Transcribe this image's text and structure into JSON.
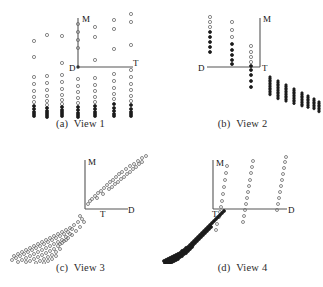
{
  "figure": {
    "background": "#ffffff",
    "point_color": "#6b6b6b",
    "dark_point_color": "#1c1c1c",
    "axis_color": "#555555",
    "label_color": "#111111",
    "caption_color": "#2b2b2b",
    "width": 323,
    "height": 287
  },
  "panels": [
    {
      "id": "a",
      "caption_index": "(a)",
      "caption_text": "View 1",
      "axis_labels": {
        "vertical": "M",
        "horizontal_far": "T",
        "origin": "D"
      }
    },
    {
      "id": "b",
      "caption_index": "(b)",
      "caption_text": "View 2",
      "axis_labels": {
        "vertical": "M",
        "horizontal_far": "T",
        "origin": "D"
      }
    },
    {
      "id": "c",
      "caption_index": "(c)",
      "caption_text": "View 3",
      "axis_labels": {
        "vertical": "M",
        "horizontal_far": "D",
        "origin": "T"
      }
    },
    {
      "id": "d",
      "caption_index": "(d)",
      "caption_text": "View 4",
      "axis_labels": {
        "vertical": "M",
        "horizontal_far": "D",
        "origin": "T"
      }
    }
  ],
  "chart_data": [
    {
      "type": "scatter",
      "panel": "a",
      "title": "(a) View 1",
      "xlabel": "T",
      "ylabel": "M",
      "origin_label": "D",
      "axes": {
        "origin": [
          78,
          67
        ],
        "y_top": [
          78,
          18
        ],
        "x_right": [
          133,
          67
        ]
      },
      "grid": false,
      "legend": "none",
      "marker": "open-circle",
      "description": "Points arranged in seven vertical columns; sparse above the horizontal axis, dense stacked clusters below it.",
      "columns": [
        {
          "x": 34,
          "ys": [
            41,
            57,
            77,
            84,
            91,
            97,
            102,
            106,
            109,
            112,
            114,
            116
          ]
        },
        {
          "x": 47,
          "ys": [
            35,
            76,
            83,
            90,
            96,
            101,
            105,
            108,
            111,
            113,
            115,
            117
          ]
        },
        {
          "x": 62,
          "ys": [
            36,
            63,
            75,
            82,
            89,
            95,
            100,
            104,
            107,
            110,
            112,
            114,
            116
          ]
        },
        {
          "x": 78,
          "ys": [
            24,
            32,
            40,
            48,
            79,
            86,
            92,
            98,
            103,
            107,
            110,
            113,
            115,
            117
          ]
        },
        {
          "x": 95,
          "ys": [
            27,
            37,
            60,
            78,
            85,
            91,
            97,
            102,
            106,
            109,
            112,
            114,
            116
          ]
        },
        {
          "x": 114,
          "ys": [
            20,
            29,
            49,
            74,
            81,
            88,
            94,
            99,
            104,
            108,
            111,
            114,
            116
          ]
        },
        {
          "x": 131,
          "ys": [
            14,
            22,
            45,
            70,
            77,
            84,
            90,
            96,
            101,
            105,
            109,
            112,
            114,
            116
          ]
        }
      ]
    },
    {
      "type": "scatter",
      "panel": "b",
      "title": "(b) View 2",
      "xlabel": "T",
      "ylabel": "M",
      "origin_label": "D",
      "axes": {
        "origin": [
          45,
          67
        ],
        "y_top": [
          98,
          18
        ],
        "x_right": [
          98,
          67
        ]
      },
      "grid": false,
      "legend": "none",
      "marker": "open-circle",
      "description": "Three vertical point columns left of the axis plus a descending diagonal train of short vertical streaks to the lower right.",
      "columns": [
        {
          "x": 48,
          "ys": [
            17,
            22,
            27,
            32,
            37,
            42,
            47,
            52
          ]
        },
        {
          "x": 70,
          "ys": [
            22,
            30,
            37,
            44,
            50,
            55,
            60,
            64
          ]
        },
        {
          "x": 89,
          "ys": [
            46,
            52,
            57,
            62,
            66,
            70,
            75,
            81,
            87
          ]
        }
      ],
      "diagonal_streaks": [
        {
          "x": 108,
          "y_start": 77,
          "y_end": 95
        },
        {
          "x": 116,
          "y_start": 81,
          "y_end": 99
        },
        {
          "x": 124,
          "y_start": 85,
          "y_end": 101
        },
        {
          "x": 132,
          "y_start": 89,
          "y_end": 104
        },
        {
          "x": 140,
          "y_start": 93,
          "y_end": 106
        },
        {
          "x": 146,
          "y_start": 96,
          "y_end": 108
        },
        {
          "x": 152,
          "y_start": 99,
          "y_end": 110
        },
        {
          "x": 157,
          "y_start": 102,
          "y_end": 112
        }
      ]
    },
    {
      "type": "scatter",
      "panel": "c",
      "title": "(c) View 3",
      "xlabel": "D",
      "ylabel": "M",
      "origin_label": "T",
      "axes": {
        "origin": [
          85,
          65
        ],
        "y_top": [
          85,
          16
        ],
        "x_right": [
          128,
          65
        ]
      },
      "grid": false,
      "legend": "none",
      "marker": "open-circle",
      "description": "A broad diagonal band of open circles rising from lower-left to upper-right, passing through the origin region.",
      "upper_arm": [
        [
          88,
          60
        ],
        [
          90,
          57
        ],
        [
          92,
          55
        ],
        [
          95,
          52
        ],
        [
          98,
          49
        ],
        [
          101,
          47
        ],
        [
          104,
          44
        ],
        [
          107,
          41
        ],
        [
          110,
          38
        ],
        [
          113,
          36
        ],
        [
          116,
          33
        ],
        [
          119,
          30
        ],
        [
          122,
          28
        ],
        [
          126,
          25
        ],
        [
          130,
          22
        ],
        [
          134,
          20
        ],
        [
          138,
          17
        ],
        [
          142,
          14
        ],
        [
          146,
          12
        ],
        [
          97,
          54
        ],
        [
          103,
          50
        ],
        [
          109,
          45
        ],
        [
          115,
          40
        ],
        [
          121,
          35
        ],
        [
          127,
          30
        ],
        [
          133,
          25
        ],
        [
          139,
          20
        ],
        [
          112,
          43
        ],
        [
          118,
          38
        ],
        [
          124,
          33
        ],
        [
          130,
          28
        ],
        [
          136,
          23
        ],
        [
          142,
          18
        ]
      ],
      "lower_band": [
        [
          14,
          112
        ],
        [
          18,
          110
        ],
        [
          22,
          108
        ],
        [
          26,
          106
        ],
        [
          30,
          104
        ],
        [
          34,
          102
        ],
        [
          38,
          100
        ],
        [
          42,
          98
        ],
        [
          46,
          96
        ],
        [
          50,
          94
        ],
        [
          54,
          92
        ],
        [
          58,
          90
        ],
        [
          62,
          88
        ],
        [
          66,
          86
        ],
        [
          70,
          84
        ],
        [
          74,
          81
        ],
        [
          78,
          78
        ],
        [
          12,
          116
        ],
        [
          16,
          114
        ],
        [
          20,
          112
        ],
        [
          24,
          110
        ],
        [
          28,
          108
        ],
        [
          32,
          106
        ],
        [
          36,
          104
        ],
        [
          40,
          102
        ],
        [
          44,
          100
        ],
        [
          48,
          98
        ],
        [
          52,
          96
        ],
        [
          56,
          94
        ],
        [
          60,
          92
        ],
        [
          64,
          90
        ],
        [
          68,
          88
        ],
        [
          72,
          85
        ],
        [
          18,
          118
        ],
        [
          22,
          116
        ],
        [
          26,
          114
        ],
        [
          30,
          112
        ],
        [
          34,
          110
        ],
        [
          38,
          108
        ],
        [
          42,
          106
        ],
        [
          46,
          104
        ],
        [
          50,
          102
        ],
        [
          54,
          100
        ],
        [
          58,
          98
        ],
        [
          62,
          96
        ],
        [
          66,
          93
        ],
        [
          70,
          90
        ],
        [
          26,
          118
        ],
        [
          30,
          117
        ],
        [
          34,
          115
        ],
        [
          38,
          113
        ],
        [
          42,
          111
        ],
        [
          46,
          109
        ],
        [
          50,
          107
        ],
        [
          54,
          105
        ],
        [
          58,
          102
        ],
        [
          62,
          99
        ],
        [
          66,
          96
        ],
        [
          36,
          119
        ],
        [
          40,
          117
        ],
        [
          44,
          115
        ],
        [
          48,
          113
        ],
        [
          52,
          111
        ],
        [
          56,
          108
        ],
        [
          60,
          105
        ],
        [
          44,
          119
        ],
        [
          48,
          117
        ],
        [
          52,
          115
        ],
        [
          56,
          112
        ],
        [
          60,
          100
        ],
        [
          64,
          97
        ],
        [
          68,
          94
        ],
        [
          72,
          91
        ],
        [
          76,
          87
        ],
        [
          80,
          83
        ],
        [
          84,
          78
        ],
        [
          82,
          75
        ],
        [
          80,
          72
        ]
      ]
    },
    {
      "type": "scatter",
      "panel": "d",
      "title": "(d) View 4",
      "xlabel": "D",
      "ylabel": "M",
      "origin_label": "T",
      "axes": {
        "origin": [
          51,
          65
        ],
        "y_top": [
          51,
          16
        ],
        "x_right": [
          125,
          65
        ]
      },
      "grid": false,
      "legend": "none",
      "marker": "open-circle",
      "description": "Three steep ascending point columns above the horizontal axis, and a dense dark curved tail descending to the lower-left.",
      "ascending_columns": [
        {
          "points": [
            [
              57,
              73
            ],
            [
              58,
              68
            ],
            [
              59,
              63
            ],
            [
              60,
              57
            ],
            [
              61,
              50
            ],
            [
              62,
              43
            ],
            [
              63,
              36
            ],
            [
              64,
              29
            ],
            [
              65,
              22
            ],
            [
              55,
              80
            ],
            [
              54,
              86
            ]
          ]
        },
        {
          "points": [
            [
              83,
              66
            ],
            [
              84,
              60
            ],
            [
              85,
              54
            ],
            [
              86,
              48
            ],
            [
              87,
              42
            ],
            [
              88,
              36
            ],
            [
              89,
              29
            ],
            [
              90,
              23
            ],
            [
              91,
              17
            ],
            [
              82,
              72
            ],
            [
              81,
              78
            ]
          ]
        },
        {
          "points": [
            [
              116,
              60
            ],
            [
              117,
              54
            ],
            [
              118,
              48
            ],
            [
              119,
              42
            ],
            [
              120,
              36
            ],
            [
              121,
              30
            ],
            [
              122,
              24
            ],
            [
              123,
              18
            ],
            [
              124,
              13
            ],
            [
              115,
              66
            ]
          ]
        }
      ],
      "dense_tail": [
        [
          2,
          117
        ],
        [
          4,
          116
        ],
        [
          6,
          115
        ],
        [
          8,
          114
        ],
        [
          10,
          113
        ],
        [
          12,
          112
        ],
        [
          14,
          111
        ],
        [
          16,
          110
        ],
        [
          18,
          109
        ],
        [
          20,
          107
        ],
        [
          22,
          106
        ],
        [
          24,
          104
        ],
        [
          26,
          103
        ],
        [
          28,
          101
        ],
        [
          30,
          99
        ],
        [
          32,
          97
        ],
        [
          34,
          95
        ],
        [
          36,
          93
        ],
        [
          38,
          91
        ],
        [
          40,
          89
        ],
        [
          42,
          87
        ],
        [
          44,
          85
        ],
        [
          46,
          83
        ],
        [
          48,
          81
        ],
        [
          50,
          79
        ],
        [
          52,
          77
        ],
        [
          54,
          75
        ],
        [
          56,
          73
        ],
        [
          58,
          71
        ],
        [
          60,
          69
        ],
        [
          62,
          67
        ],
        [
          3,
          119
        ],
        [
          5,
          118
        ],
        [
          7,
          117
        ],
        [
          9,
          116
        ],
        [
          11,
          115
        ],
        [
          13,
          114
        ],
        [
          15,
          113
        ],
        [
          17,
          112
        ],
        [
          19,
          111
        ],
        [
          21,
          109
        ],
        [
          23,
          108
        ],
        [
          25,
          106
        ],
        [
          27,
          105
        ],
        [
          29,
          103
        ],
        [
          31,
          101
        ],
        [
          33,
          99
        ],
        [
          35,
          97
        ],
        [
          37,
          95
        ],
        [
          39,
          93
        ],
        [
          41,
          91
        ],
        [
          43,
          89
        ],
        [
          45,
          87
        ],
        [
          47,
          85
        ],
        [
          49,
          83
        ],
        [
          6,
          120
        ],
        [
          8,
          119
        ],
        [
          10,
          118
        ],
        [
          12,
          117
        ],
        [
          14,
          116
        ],
        [
          16,
          115
        ],
        [
          18,
          113
        ],
        [
          20,
          112
        ],
        [
          22,
          110
        ],
        [
          24,
          109
        ],
        [
          26,
          107
        ],
        [
          28,
          105
        ],
        [
          30,
          103
        ]
      ]
    }
  ]
}
